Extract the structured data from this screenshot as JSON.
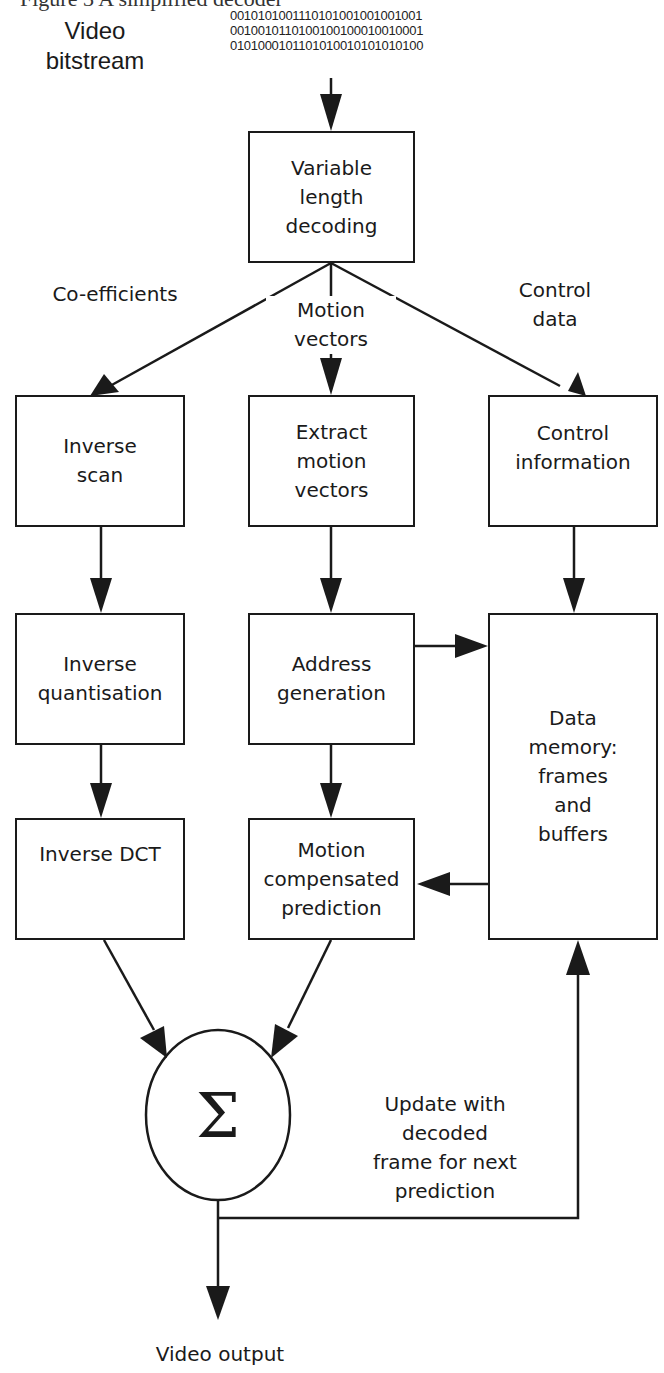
{
  "header": {
    "cutoff_caption": "Figure 3 A simplified decoder",
    "input_label": "Video\nbitstream",
    "bitstream_lines": "0010101001110101001001001001\n0010010110100100100010010001\n0101000101101010010101010100"
  },
  "blocks": {
    "vld": "Variable\nlength\ndecoding",
    "inverse_scan": "Inverse\nscan",
    "extract_mv": "Extract\nmotion\nvectors",
    "control_info": "Control\ninformation",
    "inverse_quant": "Inverse\nquantisation",
    "address_gen": "Address\ngeneration",
    "data_memory": "Data\nmemory:\nframes\nand\nbuffers",
    "inverse_dct": "Inverse DCT",
    "mc_prediction": "Motion\ncompensated\nprediction",
    "summer": "Σ"
  },
  "edge_labels": {
    "coefficients": "Co-efficients",
    "motion_vectors": "Motion\nvectors",
    "control_data": "Control\ndata",
    "feedback": "Update with\ndecoded\nframe for next\nprediction",
    "output": "Video output"
  },
  "colors": {
    "ink": "#1a1a1a",
    "background": "#ffffff"
  }
}
